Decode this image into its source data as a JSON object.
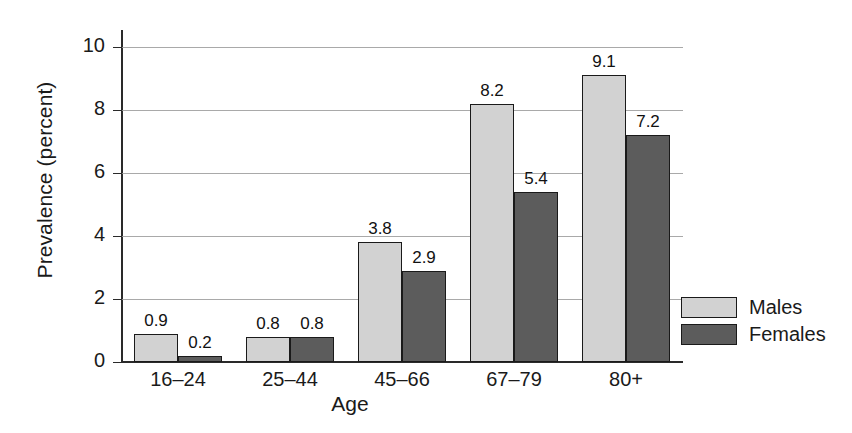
{
  "chart_data": {
    "type": "bar",
    "title": "",
    "xlabel": "Age",
    "ylabel": "Prevalence (percent)",
    "categories": [
      "16–24",
      "25–44",
      "45–66",
      "67–79",
      "80+"
    ],
    "series": [
      {
        "name": "Males",
        "color": "#d2d2d2",
        "values": [
          0.9,
          0.8,
          3.8,
          8.2,
          9.1
        ]
      },
      {
        "name": "Females",
        "color": "#5c5c5c",
        "values": [
          0.2,
          0.8,
          2.9,
          5.4,
          7.2
        ]
      }
    ],
    "value_labels": [
      [
        "0.9",
        "0.8",
        "3.8",
        "8.2",
        "9.1"
      ],
      [
        "0.2",
        "0.8",
        "2.9",
        "5.4",
        "7.2"
      ]
    ],
    "ylim": [
      0,
      10
    ],
    "yticks": [
      0,
      2,
      4,
      6,
      8,
      10
    ],
    "ytick_labels": [
      "0",
      "2",
      "4",
      "6",
      "8",
      "10"
    ],
    "grid": "horizontal",
    "legend_position": "right",
    "bar_outline_color": "#1a1a1a",
    "gridline_color": "#9a9a9a",
    "axis_color": "#2a2a2a"
  },
  "legend": {
    "entries": [
      {
        "label": "Males"
      },
      {
        "label": "Females"
      }
    ]
  }
}
